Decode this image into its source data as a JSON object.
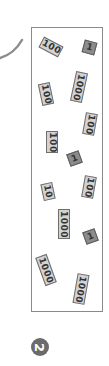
{
  "diagram": {
    "colors": {
      "frame_border": "#8a8a8a",
      "block_fill": "#d2d2d2",
      "block_border": "#6e6e6e",
      "unit_fill": "#8c8c8c",
      "badge_fill": "#6b6b6b",
      "curve_stroke": "#8c8c8c"
    },
    "tiles": [
      {
        "label": "100",
        "type": "block",
        "x": 51,
        "y": 47,
        "rotate": -62
      },
      {
        "label": "1",
        "type": "unit",
        "x": 89,
        "y": 47,
        "rotate": 15
      },
      {
        "label": "100",
        "type": "block",
        "x": 46,
        "y": 94,
        "rotate": -12
      },
      {
        "label": "1000",
        "type": "block",
        "x": 79,
        "y": 87,
        "rotate": 12
      },
      {
        "label": "100",
        "type": "block",
        "x": 90,
        "y": 124,
        "rotate": 10
      },
      {
        "label": "100",
        "type": "block",
        "x": 52,
        "y": 142,
        "rotate": 0
      },
      {
        "label": "1",
        "type": "unit",
        "x": 74,
        "y": 158,
        "rotate": -20
      },
      {
        "label": "10",
        "type": "block",
        "x": 48,
        "y": 191,
        "rotate": -12
      },
      {
        "label": "100",
        "type": "block",
        "x": 89,
        "y": 187,
        "rotate": 10
      },
      {
        "label": "1000",
        "type": "block",
        "x": 64,
        "y": 224,
        "rotate": 0
      },
      {
        "label": "1",
        "type": "unit",
        "x": 90,
        "y": 236,
        "rotate": -20
      },
      {
        "label": "1000",
        "type": "block",
        "x": 46,
        "y": 270,
        "rotate": -20
      },
      {
        "label": "1000",
        "type": "block",
        "x": 81,
        "y": 289,
        "rotate": 10
      }
    ],
    "badge": {
      "label": "2"
    }
  }
}
